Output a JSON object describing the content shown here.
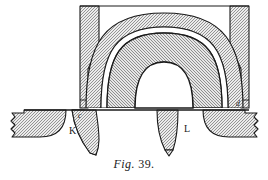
{
  "figure": {
    "caption_prefix": "Fig.",
    "caption_number": "39.",
    "caption_full": "Fig. 39.",
    "type": "engineering-cross-section",
    "background_color": "#ffffff",
    "line_color": "#1a1a1a",
    "hatch_color": "#7d7d7d",
    "hatch_background": "#e8e8e8",
    "void_color": "#ffffff"
  },
  "labels": [
    {
      "id": "label-c",
      "text": "c",
      "x": 78,
      "y": 114,
      "style": "italic",
      "size": 7
    },
    {
      "id": "label-d",
      "text": "d",
      "x": 237,
      "y": 102,
      "style": "italic",
      "size": 7
    },
    {
      "id": "label-K",
      "text": "K",
      "x": 71,
      "y": 131,
      "style": "normal",
      "size": 9
    },
    {
      "id": "label-L",
      "text": "L",
      "x": 186,
      "y": 129,
      "style": "normal",
      "size": 9
    }
  ],
  "parts": {
    "left_wall": "left upright side wall of the vault, hatched in section",
    "right_wall": "right upright side wall of the vault, hatched in section",
    "outer_arch_ring": "outer hatched arch ring spanning between the walls",
    "air_gap": "thin white annular gap separating the two arch rings",
    "inner_arch_ring": "inner hatched arch ring forming the soffit of the vault",
    "base_line": "horizontal springing / base line beneath the arch",
    "left_bracket": "left-hand hatched bracket with rounded inner corner, broken off at the left edge",
    "right_bracket": "right-hand hatched bracket with rounded inner corner, broken off at the right edge",
    "hanger_K": "tapered curved hanger leg marked K",
    "hanger_L": "tapered curved hanger leg marked L"
  }
}
